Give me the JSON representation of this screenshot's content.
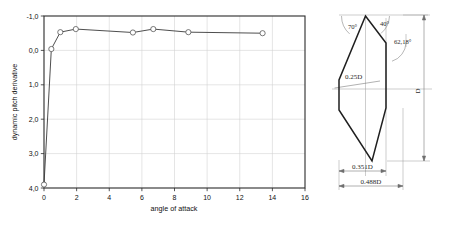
{
  "figure": {
    "left_panel_name": "dynamic-pitch-derivative-plot",
    "right_panel_name": "body-cross-section-diagram"
  },
  "chart_data": {
    "type": "line",
    "title": "",
    "xlabel": "angle of attack",
    "ylabel": "dynamic pitch derivative",
    "xlim": [
      0,
      16
    ],
    "ylim": [
      -1.0,
      4.0
    ],
    "y_inverted": true,
    "grid": true,
    "legend": "none",
    "marker": "open-circle",
    "xticks": [
      0,
      2,
      4,
      6,
      8,
      10,
      12,
      14,
      16
    ],
    "xtick_labels": [
      "0",
      "2",
      "4",
      "6",
      "8",
      "10",
      "12",
      "14",
      "16"
    ],
    "yticks": [
      -1.0,
      0.0,
      1.0,
      2.0,
      3.0,
      4.0
    ],
    "ytick_labels": [
      "-1,0",
      "0,0",
      "1,0",
      "2,0",
      "3,0",
      "4,0"
    ],
    "series": [
      {
        "name": "dynamic pitch derivative",
        "x": [
          0.0,
          0.45,
          1.0,
          1.95,
          5.45,
          6.7,
          8.85,
          13.4
        ],
        "y": [
          3.9,
          -0.04,
          -0.53,
          -0.62,
          -0.52,
          -0.62,
          -0.53,
          -0.5
        ]
      }
    ]
  },
  "diagram": {
    "name": "cross-section-outline",
    "angles": [
      {
        "id": "angle-70",
        "text": "70°"
      },
      {
        "id": "angle-40",
        "text": "40°"
      },
      {
        "id": "angle-6218",
        "text": "62,18°"
      }
    ],
    "dimensions": [
      {
        "id": "dim-025d",
        "text": "0.25D"
      },
      {
        "id": "dim-0351d",
        "text": "0.351D"
      },
      {
        "id": "dim-0488d",
        "text": "0.488D"
      },
      {
        "id": "dim-d",
        "text": "D"
      }
    ]
  },
  "colors": {
    "axis": "#2b2b2b",
    "grid": "#cfcfcf",
    "curve": "#3a3a3a",
    "marker_fill": "#ffffff",
    "marker_stroke": "#555555",
    "diagram_stroke": "#222222",
    "diagram_thin": "#8a8a8a",
    "background": "#ffffff"
  }
}
